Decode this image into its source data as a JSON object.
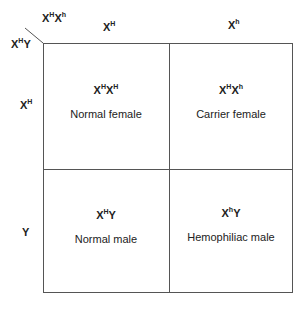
{
  "corner": {
    "top_label": {
      "base1": "X",
      "sup1": "H",
      "base2": "X",
      "sup2": "h"
    },
    "left_label": {
      "base1": "X",
      "sup1": "H",
      "base2": "Y",
      "sup2": ""
    }
  },
  "columns": [
    {
      "base": "X",
      "sup": "H"
    },
    {
      "base": "X",
      "sup": "h"
    }
  ],
  "rows": [
    {
      "base": "X",
      "sup": "H"
    },
    {
      "base": "Y",
      "sup": ""
    }
  ],
  "cells": [
    {
      "g1": "X",
      "s1": "H",
      "g2": "X",
      "s2": "H",
      "phenotype": "Normal female"
    },
    {
      "g1": "X",
      "s1": "H",
      "g2": "X",
      "s2": "h",
      "phenotype": "Carrier female"
    },
    {
      "g1": "X",
      "s1": "H",
      "g2": "Y",
      "s2": "",
      "phenotype": "Normal male"
    },
    {
      "g1": "X",
      "s1": "h",
      "g2": "Y",
      "s2": "",
      "phenotype": "Hemophiliac male"
    }
  ]
}
